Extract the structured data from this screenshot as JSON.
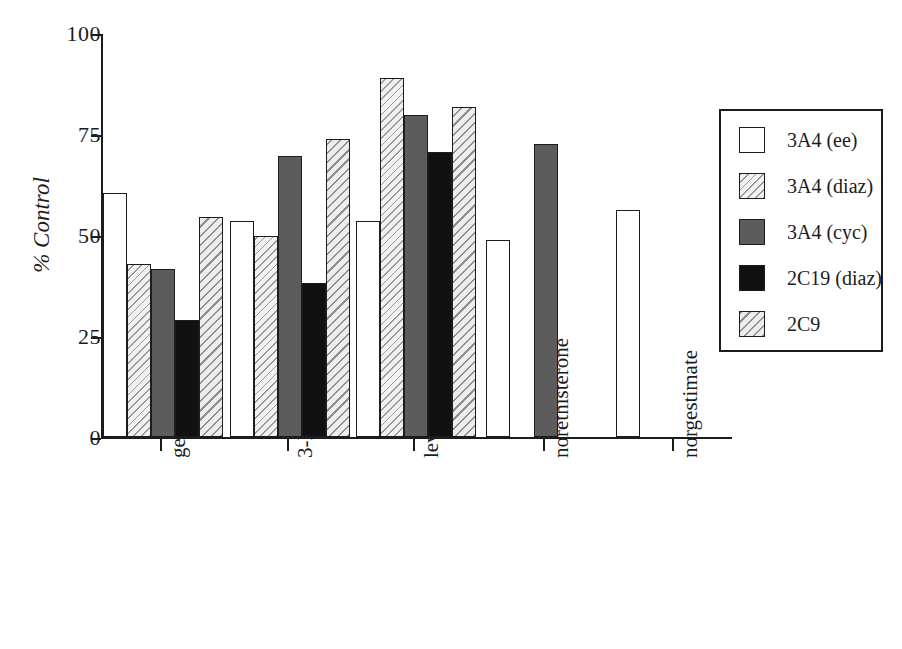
{
  "chart_data": {
    "type": "bar",
    "title": "",
    "subtitle": "",
    "xlabel": "",
    "ylabel": "% Control",
    "ylim": [
      0,
      100
    ],
    "yticks": [
      0,
      25,
      50,
      75,
      100
    ],
    "ytick_labels": [
      "0",
      "25",
      "50",
      "75",
      "100"
    ],
    "grid": false,
    "legend_position": "right",
    "categories": [
      "gestodene",
      "3-keto desogestral",
      "levonorgestral",
      "norethisterone",
      "norgestimate"
    ],
    "series": [
      {
        "name": "3A4 (ee)",
        "fill": "white",
        "color": "#ffffff",
        "values": [
          60.5,
          53.5,
          53.5,
          49.0,
          56.3
        ]
      },
      {
        "name": "3A4 (diaz)",
        "fill": "hatch-light",
        "color": "#f1f1f1",
        "values": [
          43.0,
          50.0,
          89.0,
          null,
          null
        ]
      },
      {
        "name": "3A4 (cyc)",
        "fill": "gray",
        "color": "#5c5c5c",
        "values": [
          41.8,
          69.8,
          80.0,
          72.8,
          null
        ]
      },
      {
        "name": "2C19 (diaz)",
        "fill": "black",
        "color": "#111111",
        "values": [
          29.0,
          38.3,
          70.8,
          null,
          null
        ]
      },
      {
        "name": "2C9",
        "fill": "hatch-mid",
        "color": "#ededed",
        "values": [
          54.5,
          74.0,
          81.8,
          null,
          null
        ]
      }
    ]
  },
  "axes": {
    "y_title": "% Control",
    "y_tick_labels": [
      "100",
      "75",
      "50",
      "25",
      "0"
    ],
    "x_tick_labels": [
      "gestodene",
      "3-keto desogestral",
      "levonorgestral",
      "norethisterone",
      "norgestimate"
    ]
  },
  "legend": {
    "entries": [
      {
        "label": "3A4 (ee)"
      },
      {
        "label": "3A4 (diaz)"
      },
      {
        "label": "3A4 (cyc)"
      },
      {
        "label": "2C19 (diaz)"
      },
      {
        "label": "2C9"
      }
    ]
  }
}
